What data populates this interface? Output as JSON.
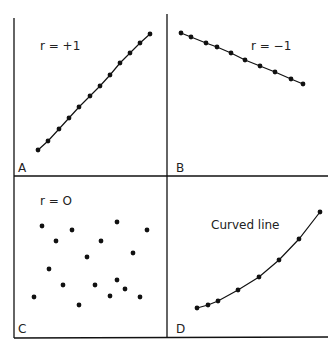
{
  "chart_data": [
    {
      "panel": "A",
      "type": "line",
      "annotation": "r = +1",
      "description": "Perfect positive correlation",
      "points": [
        [
          38,
          150
        ],
        [
          48,
          141
        ],
        [
          59,
          129
        ],
        [
          69,
          118
        ],
        [
          79,
          107
        ],
        [
          90,
          96
        ],
        [
          100,
          86
        ],
        [
          110,
          75
        ],
        [
          120,
          63
        ],
        [
          130,
          53
        ],
        [
          140,
          43
        ],
        [
          150,
          34
        ]
      ]
    },
    {
      "panel": "B",
      "type": "line",
      "annotation": "r = −1",
      "description": "Perfect negative correlation",
      "points": [
        [
          181,
          33
        ],
        [
          191,
          37
        ],
        [
          206,
          43
        ],
        [
          217,
          47
        ],
        [
          231,
          53
        ],
        [
          245,
          60
        ],
        [
          260,
          66
        ],
        [
          275,
          72
        ],
        [
          291,
          79
        ],
        [
          303,
          84
        ]
      ]
    },
    {
      "panel": "C",
      "type": "scatter",
      "annotation": "r = O",
      "description": "No correlation",
      "points": [
        [
          42,
          226
        ],
        [
          72,
          230
        ],
        [
          117,
          222
        ],
        [
          147,
          230
        ],
        [
          56,
          241
        ],
        [
          101,
          241
        ],
        [
          87,
          257
        ],
        [
          133,
          253
        ],
        [
          49,
          269
        ],
        [
          117,
          280
        ],
        [
          63,
          285
        ],
        [
          95,
          285
        ],
        [
          125,
          289
        ],
        [
          110,
          296
        ],
        [
          34,
          297
        ],
        [
          140,
          297
        ],
        [
          79,
          305
        ]
      ]
    },
    {
      "panel": "D",
      "type": "line",
      "annotation": "Curved line",
      "description": "Curvilinear relationship",
      "points": [
        [
          197,
          308
        ],
        [
          208,
          305
        ],
        [
          218,
          301
        ],
        [
          238,
          290
        ],
        [
          259,
          277
        ],
        [
          279,
          260
        ],
        [
          299,
          239
        ],
        [
          320,
          212
        ]
      ]
    }
  ],
  "panels": {
    "A": "A",
    "B": "B",
    "C": "C",
    "D": "D"
  }
}
